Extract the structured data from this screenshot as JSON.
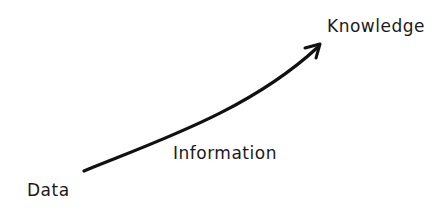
{
  "diagram": {
    "labels": {
      "start": "Data",
      "middle": "Information",
      "end": "Knowledge"
    },
    "arrow": {
      "from": "Data",
      "to": "Knowledge",
      "color": "#111111"
    }
  }
}
